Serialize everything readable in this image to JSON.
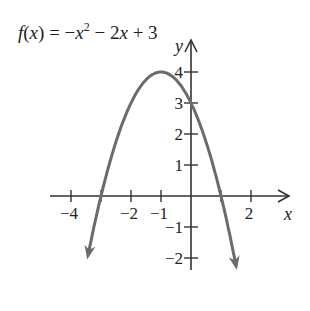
{
  "chart_data": {
    "type": "line",
    "function": "-x^2 - 2x + 3",
    "xlabel": "x",
    "ylabel": "y",
    "xlim": [
      -4.5,
      3.2
    ],
    "ylim": [
      -2.5,
      4.8
    ],
    "x_ticks": [
      -4,
      -3,
      -2,
      -1,
      1,
      2
    ],
    "x_tick_labels": [
      {
        "value": -4,
        "label": "−4"
      },
      {
        "value": -2,
        "label": "−2"
      },
      {
        "value": -1,
        "label": "−1"
      },
      {
        "value": 2,
        "label": "2"
      }
    ],
    "y_ticks": [
      -2,
      -1,
      1,
      2,
      3,
      4
    ],
    "y_tick_labels": [
      {
        "value": 4,
        "label": "4"
      },
      {
        "value": 3,
        "label": "3"
      },
      {
        "value": 2,
        "label": "2"
      },
      {
        "value": 1,
        "label": "1"
      },
      {
        "value": -1,
        "label": "−1"
      },
      {
        "value": -2,
        "label": "−2"
      }
    ],
    "key_points": {
      "vertex": [
        -1,
        4
      ],
      "y_intercept": [
        0,
        3
      ],
      "x_intercepts": [
        [
          -3,
          0
        ],
        [
          1,
          0
        ]
      ]
    },
    "x": [
      -3.4,
      -3,
      -2.5,
      -2,
      -1.5,
      -1,
      -0.5,
      0,
      0.5,
      1,
      1.5
    ],
    "y": [
      -1.76,
      0,
      1.75,
      3,
      3.75,
      4,
      3.75,
      3,
      1.75,
      0,
      -2.25
    ],
    "grid": false,
    "legend": "none",
    "curve_color": "#6b6b6b",
    "axis_color": "#333333"
  },
  "title_parts": {
    "fx": "f",
    "paren_open": "(",
    "x": "x",
    "paren_close": ")",
    "eq": " = −",
    "x2": "x",
    "exp": "2",
    "rest1": " − 2",
    "x3": "x",
    "rest2": " + 3"
  }
}
